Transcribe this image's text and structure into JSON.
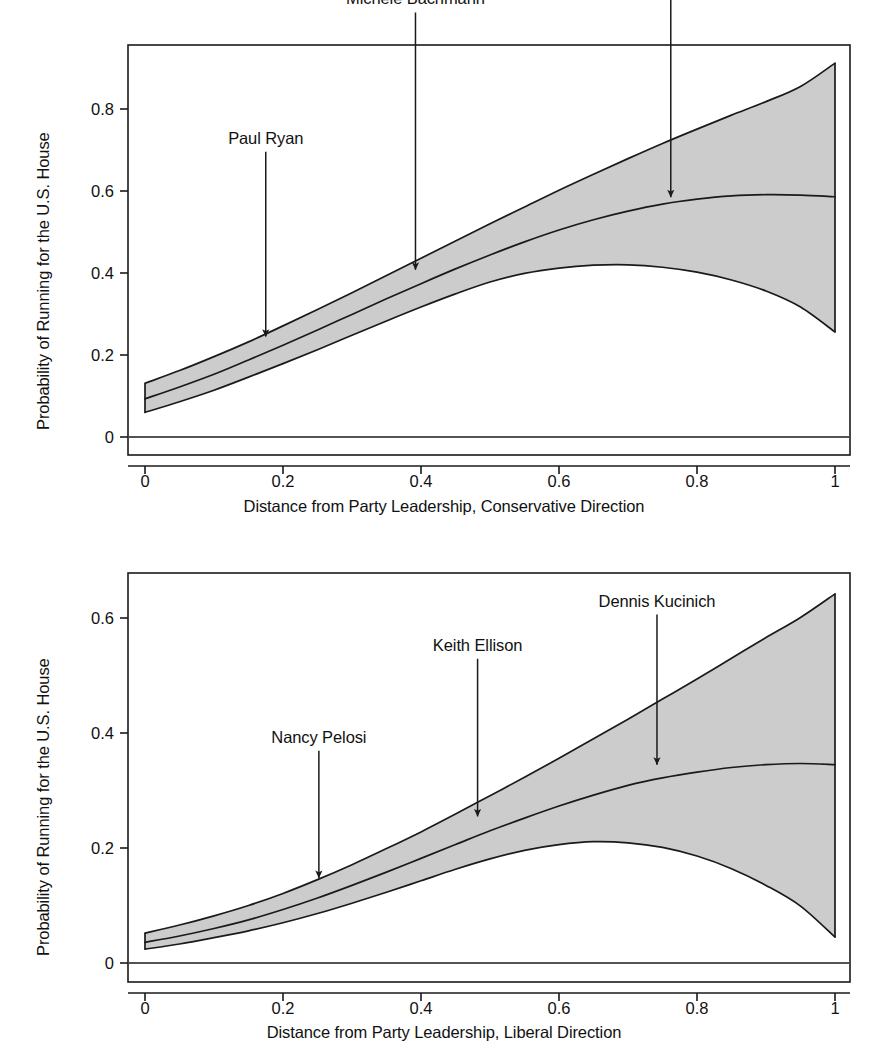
{
  "figure": {
    "width": 888,
    "height": 1052,
    "background": "#ffffff",
    "ink_color": "#1a1a1a",
    "band_fill": "#cccccc"
  },
  "chart_data": [
    {
      "type": "area",
      "id": "conservative",
      "title": "",
      "xlabel": "Distance from Party Leadership, Conservative Direction",
      "ylabel": "Probability of Running for the U.S. House",
      "xlim": [
        0,
        1
      ],
      "ylim": [
        0,
        0.95
      ],
      "xticks": [
        0,
        0.2,
        0.4,
        0.6,
        0.8,
        1
      ],
      "xticklabels": [
        "0",
        "0.2",
        "0.4",
        "0.6",
        "0.8",
        "1"
      ],
      "yticks": [
        0,
        0.2,
        0.4,
        0.6,
        0.8
      ],
      "yticklabels": [
        "0",
        "0.2",
        "0.4",
        "0.6",
        "0.8"
      ],
      "grid": false,
      "legend": "none",
      "x": [
        0,
        0.05,
        0.1,
        0.15,
        0.2,
        0.25,
        0.3,
        0.35,
        0.4,
        0.45,
        0.5,
        0.55,
        0.6,
        0.65,
        0.7,
        0.75,
        0.8,
        0.85,
        0.9,
        0.95,
        1
      ],
      "series": [
        {
          "name": "Predicted probability",
          "values": [
            0.093,
            0.122,
            0.153,
            0.188,
            0.224,
            0.261,
            0.299,
            0.337,
            0.374,
            0.41,
            0.444,
            0.476,
            0.505,
            0.53,
            0.551,
            0.568,
            0.58,
            0.588,
            0.591,
            0.59,
            0.586
          ]
        },
        {
          "name": "95% confidence interval upper",
          "values": [
            0.131,
            0.162,
            0.196,
            0.232,
            0.271,
            0.311,
            0.352,
            0.394,
            0.436,
            0.478,
            0.52,
            0.561,
            0.602,
            0.641,
            0.679,
            0.716,
            0.751,
            0.785,
            0.818,
            0.855,
            0.912
          ]
        },
        {
          "name": "95% confidence interval lower",
          "values": [
            0.06,
            0.086,
            0.114,
            0.146,
            0.179,
            0.213,
            0.248,
            0.283,
            0.317,
            0.349,
            0.378,
            0.399,
            0.412,
            0.419,
            0.42,
            0.414,
            0.402,
            0.383,
            0.356,
            0.317,
            0.256
          ]
        }
      ],
      "annotations": [
        {
          "label": "Paul Ryan",
          "x": 0.175,
          "y_text": 0.715,
          "y_tip": 0.245
        },
        {
          "label": "Michele Bachmann",
          "x": 0.392,
          "y_text": 1.055,
          "y_tip": 0.408
        },
        {
          "label": "Ron Paul",
          "x": 0.762,
          "y_text": 1.243,
          "y_tip": 0.585
        }
      ]
    },
    {
      "type": "area",
      "id": "liberal",
      "title": "",
      "xlabel": "Distance from Party Leadership, Liberal Direction",
      "ylabel": "Probability of Running for the U.S. House",
      "xlim": [
        0,
        1
      ],
      "ylim": [
        0,
        0.68
      ],
      "xticks": [
        0,
        0.2,
        0.4,
        0.6,
        0.8,
        1
      ],
      "xticklabels": [
        "0",
        "0.2",
        "0.4",
        "0.6",
        "0.8",
        "1"
      ],
      "yticks": [
        0,
        0.2,
        0.4,
        0.6
      ],
      "yticklabels": [
        "0",
        "0.2",
        "0.4",
        "0.6"
      ],
      "grid": false,
      "legend": "none",
      "x": [
        0,
        0.05,
        0.1,
        0.15,
        0.2,
        0.25,
        0.3,
        0.35,
        0.4,
        0.45,
        0.5,
        0.55,
        0.6,
        0.65,
        0.7,
        0.75,
        0.8,
        0.85,
        0.9,
        0.95,
        1
      ],
      "series": [
        {
          "name": "Predicted probability",
          "values": [
            0.036,
            0.047,
            0.06,
            0.075,
            0.093,
            0.113,
            0.135,
            0.158,
            0.182,
            0.206,
            0.23,
            0.252,
            0.273,
            0.292,
            0.309,
            0.322,
            0.332,
            0.34,
            0.345,
            0.347,
            0.345
          ]
        },
        {
          "name": "95% confidence interval upper",
          "values": [
            0.052,
            0.066,
            0.082,
            0.1,
            0.121,
            0.145,
            0.171,
            0.199,
            0.228,
            0.259,
            0.291,
            0.323,
            0.356,
            0.39,
            0.424,
            0.459,
            0.494,
            0.53,
            0.566,
            0.601,
            0.642
          ]
        },
        {
          "name": "95% confidence interval lower",
          "values": [
            0.024,
            0.033,
            0.044,
            0.056,
            0.07,
            0.086,
            0.104,
            0.123,
            0.143,
            0.163,
            0.181,
            0.196,
            0.206,
            0.211,
            0.209,
            0.201,
            0.186,
            0.164,
            0.135,
            0.099,
            0.045
          ]
        }
      ],
      "annotations": [
        {
          "label": "Nancy Pelosi",
          "x": 0.252,
          "y_text": 0.383,
          "y_tip": 0.148
        },
        {
          "label": "Keith Ellison",
          "x": 0.482,
          "y_text": 0.543,
          "y_tip": 0.255
        },
        {
          "label": "Dennis Kucinich",
          "x": 0.742,
          "y_text": 0.62,
          "y_tip": 0.345
        }
      ]
    }
  ]
}
